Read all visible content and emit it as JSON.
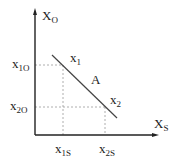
{
  "diagram": {
    "type": "line-on-axes",
    "axes": {
      "y_label": {
        "main": "X",
        "sub": "O"
      },
      "x_label": {
        "main": "X",
        "sub": "S"
      }
    },
    "line_label": "A",
    "points": [
      {
        "label": {
          "main": "x",
          "sub": "1"
        },
        "y_tick": {
          "main": "x",
          "sub": "1O"
        },
        "x_tick": {
          "main": "x",
          "sub": "1S"
        }
      },
      {
        "label": {
          "main": "x",
          "sub": "2"
        },
        "y_tick": {
          "main": "x",
          "sub": "2O"
        },
        "x_tick": {
          "main": "x",
          "sub": "2S"
        }
      }
    ]
  },
  "colors": {
    "axis": "#222222",
    "line": "#444444",
    "dashed": "#999999",
    "background": "#ffffff"
  }
}
